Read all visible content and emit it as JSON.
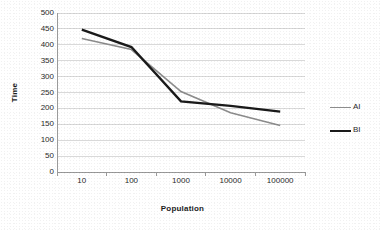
{
  "chart_data": {
    "type": "line",
    "title": "",
    "xlabel": "Population",
    "ylabel": "Time",
    "categories": [
      "10",
      "100",
      "1000",
      "10000",
      "100000"
    ],
    "ylim": [
      0,
      500
    ],
    "yticks": [
      "0",
      "50",
      "100",
      "150",
      "200",
      "250",
      "300",
      "350",
      "400",
      "450",
      "500"
    ],
    "grid": "horizontal",
    "legend_position": "right",
    "series": [
      {
        "name": "AI",
        "color": "#8c8c8c",
        "width": 1.6,
        "values": [
          420,
          385,
          253,
          186,
          146
        ]
      },
      {
        "name": "BI",
        "color": "#1a1a1a",
        "width": 2.4,
        "values": [
          448,
          393,
          222,
          208,
          190
        ]
      }
    ]
  },
  "axes": {
    "y_title": "Time",
    "x_title": "Population",
    "axis_color": "#9a9a9a",
    "grid_color": "#d9d9d9"
  },
  "legend": {
    "entries": [
      {
        "label": "AI"
      },
      {
        "label": "BI"
      }
    ]
  }
}
